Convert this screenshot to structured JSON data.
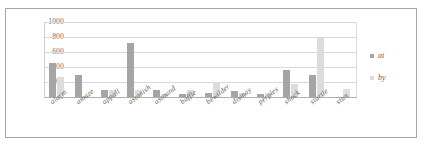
{
  "chart_data": {
    "type": "bar",
    "title": "",
    "xlabel": "",
    "ylabel": "",
    "ylim": [
      0,
      1000
    ],
    "yticks": [
      "0",
      "200",
      "400",
      "600",
      "800",
      "1000"
    ],
    "grid": true,
    "legend_position": "right",
    "categories": [
      "alarm",
      "amaze",
      "appall",
      "astonish",
      "astound",
      "baffle",
      "bewilder",
      "dismay",
      "perplex",
      "shock",
      "startle",
      "stun"
    ],
    "series": [
      {
        "name": "at",
        "color": "#a5a5a5",
        "values": [
          460,
          300,
          100,
          715,
          90,
          35,
          60,
          85,
          35,
          355,
          300,
          5
        ]
      },
      {
        "name": "by",
        "color": "#dcdcdc",
        "values": [
          270,
          10,
          95,
          95,
          45,
          95,
          205,
          50,
          60,
          175,
          790,
          105
        ]
      }
    ]
  },
  "legend": {
    "items": [
      {
        "label": "at",
        "swatch": "at"
      },
      {
        "label": "by",
        "swatch": "by"
      }
    ]
  },
  "colors": {
    "series_at": "#a5a5a5",
    "series_by": "#dcdcdc",
    "gridline": "#d9d9d9",
    "axis": "#b0b0b0",
    "text": "#5f5f5f",
    "border": "#a6a6a6"
  }
}
